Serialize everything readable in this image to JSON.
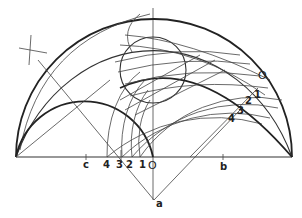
{
  "figure": {
    "type": "geometric-construction",
    "labels": {
      "O_top": "O",
      "O_base": "O",
      "a": "a",
      "b": "b",
      "c": "c",
      "right_1": "1",
      "right_2": "2",
      "right_3": "3",
      "right_4": "4",
      "base_1": "1",
      "base_2": "2",
      "base_3": "3",
      "base_4": "4"
    },
    "colors": {
      "ink": "#222222",
      "background": "#ffffff"
    }
  }
}
